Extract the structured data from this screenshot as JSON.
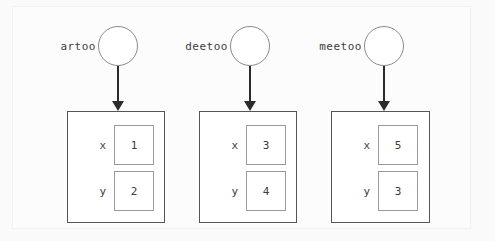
{
  "diagram": {
    "type": "object-reference-diagram",
    "title": "",
    "colors": {
      "background": "#fafafa",
      "page": "#fcfcfc",
      "box_border": "#555555",
      "value_border": "#9a9a9a",
      "circle_border": "#8a8a8a",
      "arrow": "#2b2b2b",
      "text": "#3c3c3c"
    },
    "objects": [
      {
        "reference_label": "artoo",
        "circle_icon": "object-reference-circle",
        "arrow_icon": "down-arrow-icon",
        "attributes": [
          {
            "name": "x",
            "value": "1"
          },
          {
            "name": "y",
            "value": "2"
          }
        ]
      },
      {
        "reference_label": "deetoo",
        "circle_icon": "object-reference-circle",
        "arrow_icon": "down-arrow-icon",
        "attributes": [
          {
            "name": "x",
            "value": "3"
          },
          {
            "name": "y",
            "value": "4"
          }
        ]
      },
      {
        "reference_label": "meetoo",
        "circle_icon": "object-reference-circle",
        "arrow_icon": "down-arrow-icon",
        "attributes": [
          {
            "name": "x",
            "value": "5"
          },
          {
            "name": "y",
            "value": "3"
          }
        ]
      }
    ]
  }
}
